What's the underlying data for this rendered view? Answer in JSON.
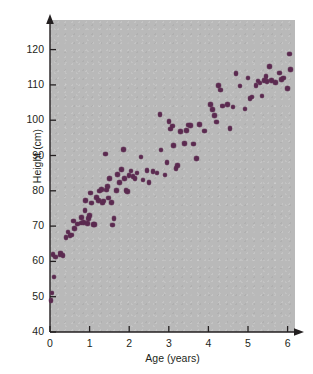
{
  "chart_data": {
    "type": "scatter",
    "title": "",
    "xlabel": "Age (years)",
    "ylabel": "Height (cm)",
    "xlim": [
      0,
      6.8
    ],
    "ylim": [
      40,
      124
    ],
    "xticks": [
      0,
      1,
      2,
      3,
      4,
      5,
      6
    ],
    "xticklabels": [
      "0",
      "1",
      "2",
      "3",
      "4",
      "5",
      "6"
    ],
    "yticks": [
      40,
      50,
      60,
      70,
      80,
      90,
      100,
      110,
      120
    ],
    "yticklabels": [
      "40",
      "50",
      "60",
      "70",
      "80",
      "90",
      "100",
      "110",
      "120"
    ],
    "grid": false,
    "legend": null,
    "marker_color": "#5b2a50",
    "plot_background": "#b9b9b9",
    "page_background": "#ffffff",
    "axis_arrows": true,
    "n_points": 110,
    "points": [
      [
        0.03,
        48.9
      ],
      [
        0.05,
        51.0
      ],
      [
        0.1,
        55.6
      ],
      [
        0.08,
        62.0
      ],
      [
        0.14,
        61.2
      ],
      [
        0.25,
        61.8
      ],
      [
        0.27,
        62.4
      ],
      [
        0.33,
        61.6
      ],
      [
        0.4,
        66.8
      ],
      [
        0.45,
        68.3
      ],
      [
        0.5,
        67.3
      ],
      [
        0.55,
        67.5
      ],
      [
        0.6,
        71.4
      ],
      [
        0.62,
        69.4
      ],
      [
        0.7,
        70.6
      ],
      [
        0.78,
        70.9
      ],
      [
        0.8,
        72.5
      ],
      [
        0.85,
        71.1
      ],
      [
        0.88,
        74.4
      ],
      [
        0.9,
        77.2
      ],
      [
        0.95,
        70.8
      ],
      [
        0.97,
        72.2
      ],
      [
        1.0,
        73.0
      ],
      [
        1.02,
        79.4
      ],
      [
        1.05,
        76.5
      ],
      [
        1.1,
        70.5
      ],
      [
        1.12,
        70.4
      ],
      [
        1.18,
        78.1
      ],
      [
        1.22,
        77.3
      ],
      [
        1.25,
        79.9
      ],
      [
        1.3,
        80.3
      ],
      [
        1.32,
        76.6
      ],
      [
        1.35,
        77.1
      ],
      [
        1.4,
        90.4
      ],
      [
        1.42,
        80.2
      ],
      [
        1.45,
        81.2
      ],
      [
        1.48,
        78.0
      ],
      [
        1.5,
        83.4
      ],
      [
        1.55,
        76.7
      ],
      [
        1.58,
        70.3
      ],
      [
        1.62,
        72.1
      ],
      [
        1.68,
        80.1
      ],
      [
        1.7,
        84.6
      ],
      [
        1.75,
        82.3
      ],
      [
        1.8,
        86.0
      ],
      [
        1.85,
        91.7
      ],
      [
        1.88,
        83.5
      ],
      [
        1.92,
        80.1
      ],
      [
        1.95,
        79.8
      ],
      [
        2.0,
        84.3
      ],
      [
        2.05,
        85.6
      ],
      [
        2.1,
        84.1
      ],
      [
        2.15,
        83.4
      ],
      [
        2.2,
        85.0
      ],
      [
        2.3,
        89.6
      ],
      [
        2.35,
        83.1
      ],
      [
        2.45,
        85.7
      ],
      [
        2.5,
        82.3
      ],
      [
        2.6,
        85.5
      ],
      [
        2.7,
        85.0
      ],
      [
        2.78,
        101.6
      ],
      [
        2.8,
        91.6
      ],
      [
        2.9,
        84.5
      ],
      [
        2.95,
        88.0
      ],
      [
        3.0,
        99.6
      ],
      [
        3.05,
        97.5
      ],
      [
        3.1,
        98.3
      ],
      [
        3.12,
        92.8
      ],
      [
        3.18,
        86.4
      ],
      [
        3.22,
        87.2
      ],
      [
        3.3,
        96.8
      ],
      [
        3.4,
        93.4
      ],
      [
        3.45,
        97.1
      ],
      [
        3.5,
        98.6
      ],
      [
        3.55,
        98.5
      ],
      [
        3.62,
        93.2
      ],
      [
        3.7,
        89.2
      ],
      [
        3.78,
        98.8
      ],
      [
        3.9,
        96.9
      ],
      [
        4.05,
        104.5
      ],
      [
        4.1,
        103.0
      ],
      [
        4.15,
        101.4
      ],
      [
        4.2,
        99.5
      ],
      [
        4.25,
        109.9
      ],
      [
        4.3,
        108.6
      ],
      [
        4.35,
        104.0
      ],
      [
        4.48,
        104.4
      ],
      [
        4.55,
        97.6
      ],
      [
        4.62,
        103.7
      ],
      [
        4.7,
        113.2
      ],
      [
        4.8,
        109.7
      ],
      [
        4.92,
        103.2
      ],
      [
        5.0,
        111.9
      ],
      [
        5.05,
        106.2
      ],
      [
        5.1,
        106.6
      ],
      [
        5.2,
        109.8
      ],
      [
        5.25,
        111.1
      ],
      [
        5.3,
        110.5
      ],
      [
        5.35,
        106.8
      ],
      [
        5.4,
        111.3
      ],
      [
        5.45,
        112.4
      ],
      [
        5.48,
        110.9
      ],
      [
        5.55,
        115.2
      ],
      [
        5.6,
        111.2
      ],
      [
        5.7,
        110.7
      ],
      [
        5.8,
        113.4
      ],
      [
        5.85,
        111.6
      ],
      [
        5.9,
        112.0
      ],
      [
        6.0,
        108.9
      ],
      [
        6.05,
        118.7
      ],
      [
        6.08,
        114.4
      ]
    ]
  },
  "axis": {
    "x_title": "Age (years)",
    "y_title": "Height (cm)"
  }
}
